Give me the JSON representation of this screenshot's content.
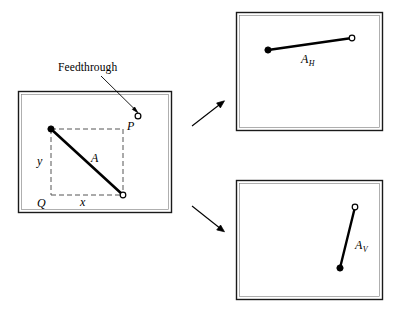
{
  "figure": {
    "type": "schematic-diagram",
    "stroke_color": "#000000",
    "background_color": "#ffffff",
    "dash_color": "#555555"
  },
  "annotations": {
    "feedthrough_label": "Feedthrough"
  },
  "main_box": {
    "name": "enclosure",
    "frame": {
      "x": 18,
      "y": 91,
      "width": 154,
      "height": 122
    },
    "labels": {
      "point_p": "P",
      "point_q": "Q",
      "antenna": "A",
      "horizontal_extent": "x",
      "vertical_extent": "y"
    },
    "points": {
      "feedthrough_terminal": {
        "label": "P",
        "x": 138,
        "y": 116,
        "marker": "open-circle"
      },
      "corner_q": {
        "label": "Q",
        "x": 51,
        "y": 196,
        "marker": "none"
      },
      "antenna_start": {
        "x": 51,
        "y": 129,
        "marker": "filled-circle"
      },
      "antenna_end": {
        "x": 123,
        "y": 195,
        "marker": "open-circle"
      }
    },
    "dashed_rect": {
      "x": 51,
      "y": 129,
      "width": 72,
      "height": 66
    }
  },
  "top_right_box": {
    "name": "horizontal-component",
    "frame": {
      "x": 236,
      "y": 12,
      "width": 147,
      "height": 119
    },
    "label": "A",
    "subscript": "H",
    "points": {
      "start": {
        "x": 268,
        "y": 50,
        "marker": "filled-circle"
      },
      "end": {
        "x": 352,
        "y": 38,
        "marker": "open-circle"
      }
    }
  },
  "bottom_right_box": {
    "name": "vertical-component",
    "frame": {
      "x": 236,
      "y": 180,
      "width": 147,
      "height": 120
    },
    "label": "A",
    "subscript": "V",
    "points": {
      "start": {
        "x": 340,
        "y": 268,
        "marker": "filled-circle"
      },
      "end": {
        "x": 355,
        "y": 207,
        "marker": "open-circle"
      }
    }
  },
  "arrows": [
    {
      "name": "arrow-to-horizontal",
      "from": {
        "x": 192,
        "y": 126
      },
      "to": {
        "x": 224,
        "y": 101
      }
    },
    {
      "name": "arrow-to-vertical",
      "from": {
        "x": 192,
        "y": 206
      },
      "to": {
        "x": 224,
        "y": 232
      }
    }
  ]
}
